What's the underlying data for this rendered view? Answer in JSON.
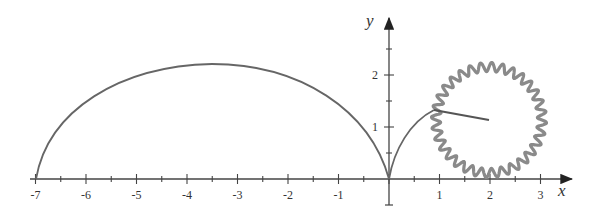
{
  "figure": {
    "x_axis_label": "x",
    "y_axis_label": "y",
    "x_ticks": [
      "-7",
      "-6",
      "-5",
      "-4",
      "-3",
      "-2",
      "-1",
      "1",
      "2",
      "3"
    ],
    "y_ticks": [
      "1",
      "2"
    ],
    "colors": {
      "axis": "#444444",
      "curve": "#666666",
      "gear": "#8a8a8a",
      "arm": "#555555"
    }
  }
}
